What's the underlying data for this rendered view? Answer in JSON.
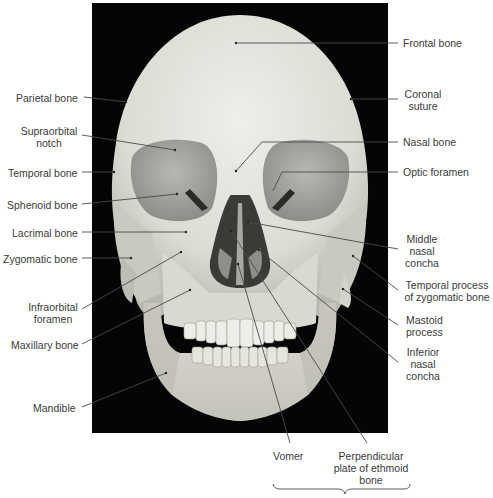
{
  "figure": {
    "background_color": "#050505",
    "bone_color": "#e2e2dc",
    "leader_color": "#4a4a4a"
  },
  "labels": {
    "left": [
      {
        "id": "parietal-bone",
        "lines": [
          "Parietal bone"
        ],
        "text": "Parietal bone",
        "x": 16,
        "y": 92,
        "anchor": [
          84,
          97
        ],
        "target": [
          126,
          102
        ]
      },
      {
        "id": "supraorbital-notch",
        "lines": [
          "Supraorbital",
          "notch"
        ],
        "text": "Supraorbital notch",
        "x": 19,
        "y": 125,
        "anchor": [
          82,
          135
        ],
        "target": [
          175,
          150
        ]
      },
      {
        "id": "temporal-bone",
        "lines": [
          "Temporal bone"
        ],
        "text": "Temporal bone",
        "x": 8,
        "y": 167,
        "anchor": [
          82,
          172
        ],
        "target": [
          114,
          172
        ]
      },
      {
        "id": "sphenoid-bone",
        "lines": [
          "Sphenoid bone"
        ],
        "text": "Sphenoid bone",
        "x": 8,
        "y": 199,
        "anchor": [
          82,
          204
        ],
        "target": [
          177,
          194
        ]
      },
      {
        "id": "lacrimal-bone",
        "lines": [
          "Lacrimal bone"
        ],
        "text": "Lacrimal bone",
        "x": 12,
        "y": 227,
        "anchor": [
          82,
          232
        ],
        "target": [
          186,
          232
        ]
      },
      {
        "id": "zygomatic-bone",
        "lines": [
          "Zygomatic bone"
        ],
        "text": "Zygomatic bone",
        "x": 3,
        "y": 253,
        "anchor": [
          82,
          258
        ],
        "target": [
          131,
          258
        ]
      },
      {
        "id": "infraorbital-foramen",
        "lines": [
          "Infraorbital",
          "foramen"
        ],
        "text": "Infraorbital foramen",
        "x": 28,
        "y": 301,
        "anchor": [
          82,
          309
        ],
        "target": [
          181,
          252
        ]
      },
      {
        "id": "maxillary-bone",
        "lines": [
          "Maxillary bone"
        ],
        "text": "Maxillary bone",
        "x": 11,
        "y": 339,
        "anchor": [
          82,
          344
        ],
        "target": [
          190,
          290
        ]
      },
      {
        "id": "mandible",
        "lines": [
          "Mandible"
        ],
        "text": "Mandible",
        "x": 33,
        "y": 402,
        "anchor": [
          82,
          407
        ],
        "target": [
          166,
          373
        ]
      }
    ],
    "right": [
      {
        "id": "frontal-bone",
        "lines": [
          "Frontal bone"
        ],
        "text": "Frontal bone",
        "x": 403,
        "y": 37,
        "anchor": [
          398,
          43
        ],
        "target": [
          236,
          43
        ]
      },
      {
        "id": "coronal-suture",
        "lines": [
          "Coronal",
          "suture"
        ],
        "text": "Coronal suture",
        "x": 405,
        "y": 88,
        "anchor": [
          398,
          99
        ],
        "target": [
          351,
          99
        ]
      },
      {
        "id": "nasal-bone",
        "lines": [
          "Nasal bone"
        ],
        "text": "Nasal bone",
        "x": 403,
        "y": 136,
        "anchor": [
          398,
          142
        ],
        "target": [
          236,
          171
        ]
      },
      {
        "id": "optic-foramen",
        "lines": [
          "Optic foramen"
        ],
        "text": "Optic foramen",
        "x": 403,
        "y": 165,
        "anchor": [
          398,
          172
        ],
        "target": [
          273,
          191
        ]
      },
      {
        "id": "middle-nasal-concha",
        "lines": [
          "Middle",
          "nasal",
          "concha"
        ],
        "text": "Middle nasal concha",
        "x": 407,
        "y": 233,
        "anchor": [
          398,
          249
        ],
        "target": [
          248,
          222
        ]
      },
      {
        "id": "temporal-process-zygomatic",
        "lines": [
          "Temporal process",
          "of zygomatic bone"
        ],
        "text": "Temporal process of zygomatic bone",
        "x": 406,
        "y": 279,
        "anchor": [
          398,
          290
        ],
        "target": [
          353,
          256
        ]
      },
      {
        "id": "mastoid-process",
        "lines": [
          "Mastoid",
          "process"
        ],
        "text": "Mastoid process",
        "x": 406,
        "y": 314,
        "anchor": [
          398,
          325
        ],
        "target": [
          343,
          289
        ]
      },
      {
        "id": "inferior-nasal-concha",
        "lines": [
          "Inferior",
          "nasal",
          "concha"
        ],
        "text": "Inferior nasal concha",
        "x": 406,
        "y": 346,
        "anchor": [
          398,
          362
        ],
        "target": [
          259,
          250
        ]
      }
    ],
    "bottom": [
      {
        "id": "vomer",
        "lines": [
          "Vomer"
        ],
        "text": "Vomer",
        "x": 272,
        "y": 448,
        "anchor": [
          290,
          443
        ],
        "target": [
          238,
          264
        ]
      },
      {
        "id": "perpendicular-plate-ethmoid",
        "lines": [
          "Perpendicular",
          "plate of ethmoid",
          "bone"
        ],
        "text": "Perpendicular plate of ethmoid bone",
        "x": 336,
        "y": 448,
        "anchor": [
          367,
          443
        ],
        "target": [
          231,
          231
        ]
      }
    ]
  },
  "brace": {
    "x1": 273,
    "x2": 410,
    "y": 484,
    "tip_x": 345,
    "tip_y": 493,
    "spans_labels": [
      "Vomer",
      "Perpendicular plate of ethmoid bone"
    ]
  }
}
